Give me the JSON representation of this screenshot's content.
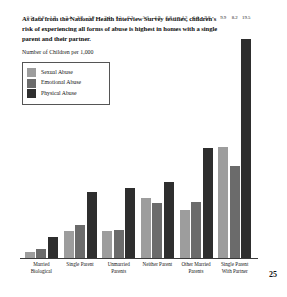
{
  "document": {
    "headline": "As data from the National Health Interview Survey testifies, children's risk of experiencing all forms of abuse is highest in homes with a single parent and their partner.",
    "axis_caption": "Number of Children per 1,000",
    "page_number": "25"
  },
  "legend": {
    "items": [
      {
        "label": "Sexual Abuse",
        "color": "#9d9d9d"
      },
      {
        "label": "Emotional Abuse",
        "color": "#6b6b6b"
      },
      {
        "label": "Physical Abuse",
        "color": "#2e2e2e"
      }
    ]
  },
  "chart_data": {
    "type": "bar",
    "title": "As data from the National Health Interview Survey testifies, children's risk of experiencing all forms of abuse is highest in homes with a single parent and their partner.",
    "xlabel": "",
    "ylabel": "Number of Children per 1,000",
    "ylim": [
      0,
      21
    ],
    "grid": false,
    "legend_position": "top-left",
    "categories": [
      "Married Biological",
      "Single Parent",
      "Unmarried Parents",
      "Neither Parent",
      "Other Married Parents",
      "Single Parent With Partner"
    ],
    "series": [
      {
        "name": "Sexual Abuse",
        "color": "#9d9d9d",
        "values": [
          0.5,
          2.4,
          2.4,
          5.3,
          4.3,
          9.9
        ]
      },
      {
        "name": "Emotional Abuse",
        "color": "#6b6b6b",
        "values": [
          0.8,
          2.9,
          2.5,
          4.9,
          5.0,
          8.2
        ]
      },
      {
        "name": "Physical Abuse",
        "color": "#2e2e2e",
        "values": [
          1.9,
          5.9,
          6.2,
          6.8,
          9.8,
          19.5
        ]
      }
    ]
  }
}
